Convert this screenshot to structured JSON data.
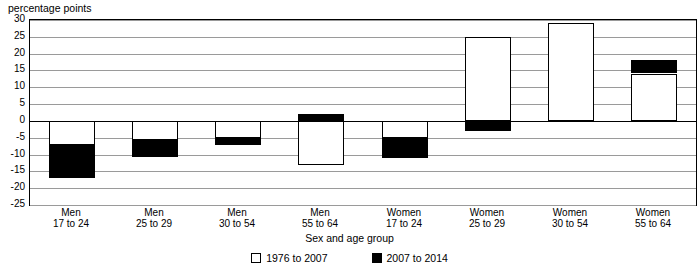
{
  "axis": {
    "y_unit_label": "percentage points",
    "x_title": "Sex and age group",
    "y_ticks": [
      "30",
      "25",
      "20",
      "15",
      "10",
      "5",
      "0",
      "-5",
      "-10",
      "-15",
      "-20",
      "-25"
    ]
  },
  "legend": {
    "items": [
      {
        "label": "1976 to 2007",
        "swatch": "white-square-icon",
        "color": "#ffffff"
      },
      {
        "label": "2007 to 2014",
        "swatch": "black-square-icon",
        "color": "#000000"
      }
    ]
  },
  "chart_data": {
    "type": "bar",
    "title": "",
    "subtitle": "",
    "xlabel": "Sex and age group",
    "ylabel": "percentage points",
    "ylim": [
      -25,
      30
    ],
    "ytick_step": 5,
    "grid": true,
    "stacked": true,
    "legend_position": "bottom",
    "categories": [
      "Men 17 to 24",
      "Men 25 to 29",
      "Men 30 to 54",
      "Men 55 to 64",
      "Women 17 to 24",
      "Women 25 to 29",
      "Women 30 to 54",
      "Women 55 to 64"
    ],
    "category_lines": [
      {
        "line1": "Men",
        "line2": "17 to 24"
      },
      {
        "line1": "Men",
        "line2": "25 to 29"
      },
      {
        "line1": "Men",
        "line2": "30 to 54"
      },
      {
        "line1": "Men",
        "line2": "55 to 64"
      },
      {
        "line1": "Women",
        "line2": "17 to 24"
      },
      {
        "line1": "Women",
        "line2": "25 to 29"
      },
      {
        "line1": "Women",
        "line2": "30 to 54"
      },
      {
        "line1": "Women",
        "line2": "55 to 64"
      }
    ],
    "series": [
      {
        "name": "1976 to 2007",
        "color": "#ffffff",
        "values": [
          -7,
          -5.5,
          -5,
          -13,
          -5,
          25,
          29,
          14
        ]
      },
      {
        "name": "2007 to 2014",
        "color": "#000000",
        "values": [
          -10,
          -5.5,
          -2,
          2,
          -6,
          -3,
          0,
          4
        ]
      }
    ],
    "segments": [
      {
        "category": "Men 17 to 24",
        "white": {
          "from": 0,
          "to": -7
        },
        "black": {
          "from": -7,
          "to": -17
        }
      },
      {
        "category": "Men 25 to 29",
        "white": {
          "from": 0,
          "to": -5.5
        },
        "black": {
          "from": -5.5,
          "to": -11
        }
      },
      {
        "category": "Men 30 to 54",
        "white": {
          "from": 0,
          "to": -5
        },
        "black": {
          "from": -5,
          "to": -7
        }
      },
      {
        "category": "Men 55 to 64",
        "white": {
          "from": 0,
          "to": -13
        },
        "black": {
          "from": 0,
          "to": 2
        }
      },
      {
        "category": "Women 17 to 24",
        "white": {
          "from": 0,
          "to": -5
        },
        "black": {
          "from": -5,
          "to": -11
        }
      },
      {
        "category": "Women 25 to 29",
        "white": {
          "from": 0,
          "to": 25
        },
        "black": {
          "from": 0,
          "to": -3
        }
      },
      {
        "category": "Women 30 to 54",
        "white": {
          "from": 0,
          "to": 29
        },
        "black": null
      },
      {
        "category": "Women 55 to 64",
        "white": {
          "from": 0,
          "to": 14
        },
        "black": {
          "from": 14,
          "to": 18
        }
      }
    ],
    "totals": [
      -17,
      -11,
      -7,
      -11,
      -11,
      22,
      29,
      18
    ]
  }
}
